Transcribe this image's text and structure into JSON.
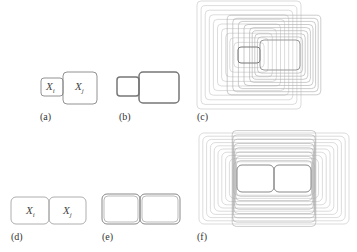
{
  "figure": {
    "panels": [
      {
        "id": "a",
        "label": "(a)",
        "vars": [
          "X",
          "X"
        ],
        "subs": [
          "i",
          "j"
        ]
      },
      {
        "id": "b",
        "label": "(b)"
      },
      {
        "id": "c",
        "label": "(c)"
      },
      {
        "id": "d",
        "label": "(d)",
        "vars": [
          "X",
          "X"
        ],
        "subs": [
          "i",
          "j"
        ]
      },
      {
        "id": "e",
        "label": "(e)"
      },
      {
        "id": "f",
        "label": "(f)"
      }
    ]
  },
  "colors": {
    "stroke_dark": "#777777",
    "stroke_light": "#c4c4c4",
    "text": "#333333"
  }
}
